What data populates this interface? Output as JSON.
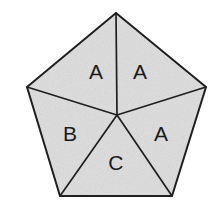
{
  "figure": {
    "shape": "regular-pentagon",
    "background_color": "#ffffff",
    "fill_color": "#dedede",
    "line_color": "#1f1f1f",
    "texture": "speckled-scan-grain",
    "center_point": {
      "x": 117,
      "y": 115
    },
    "vertices": [
      {
        "name": "apex",
        "x": 116,
        "y": 13
      },
      {
        "name": "right-upper",
        "x": 206,
        "y": 87
      },
      {
        "name": "right-lower",
        "x": 172,
        "y": 196
      },
      {
        "name": "left-lower",
        "x": 60,
        "y": 196
      },
      {
        "name": "left-upper",
        "x": 27,
        "y": 87
      }
    ],
    "regions": [
      {
        "id": "region-top-left",
        "label": "A",
        "label_x": 96,
        "label_y": 71
      },
      {
        "id": "region-top-right",
        "label": "A",
        "label_x": 140,
        "label_y": 71
      },
      {
        "id": "region-right",
        "label": "A",
        "label_x": 161,
        "label_y": 133
      },
      {
        "id": "region-bottom",
        "label": "C",
        "label_x": 116,
        "label_y": 162
      },
      {
        "id": "region-left",
        "label": "B",
        "label_x": 70,
        "label_y": 133
      }
    ],
    "labels_legend": [
      "A",
      "B",
      "C"
    ]
  }
}
